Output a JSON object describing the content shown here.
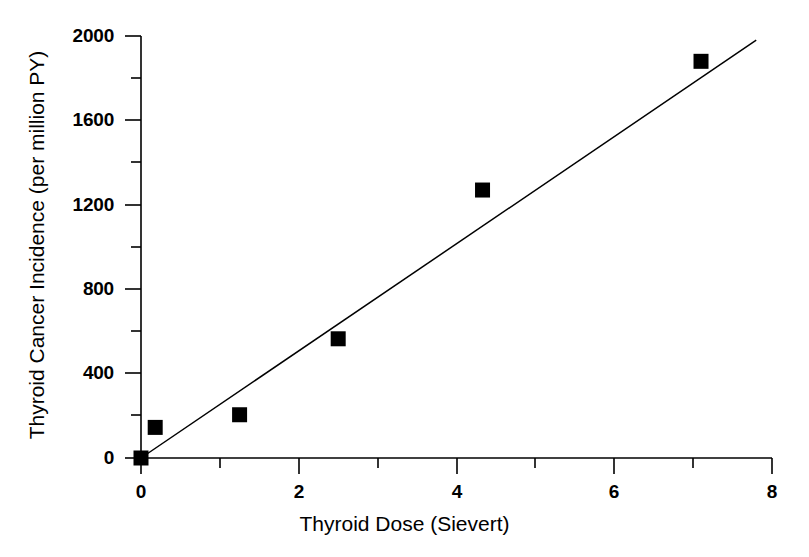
{
  "chart_data": {
    "type": "scatter",
    "title": "",
    "xlabel": "Thyroid Dose (Sievert)",
    "ylabel": "Thyroid Cancer Incidence (per million PY)",
    "xlim": [
      0,
      8
    ],
    "ylim": [
      0,
      2000
    ],
    "grid": false,
    "legend": null,
    "x_major_ticks": [
      0,
      2,
      4,
      6,
      8
    ],
    "x_minor_ticks": [
      1,
      3,
      5,
      7
    ],
    "x_tick_labels": [
      "0",
      "2",
      "4",
      "6",
      "8"
    ],
    "y_major_ticks": [
      0,
      400,
      800,
      1200,
      1600,
      2000
    ],
    "y_minor_ticks": [
      200,
      600,
      1000,
      1400,
      1800
    ],
    "y_tick_labels": [
      "0",
      "400",
      "800",
      "1200",
      "1600",
      "2000"
    ],
    "marker": {
      "shape": "square",
      "color": "#000000",
      "size_px": 15
    },
    "points": [
      {
        "x": 0.0,
        "y": 0
      },
      {
        "x": 0.18,
        "y": 145
      },
      {
        "x": 1.25,
        "y": 205
      },
      {
        "x": 2.5,
        "y": 565
      },
      {
        "x": 4.33,
        "y": 1270
      },
      {
        "x": 7.1,
        "y": 1880
      }
    ],
    "series": [
      {
        "name": "Thyroid cancer incidence by dose",
        "x": [
          0.0,
          0.18,
          1.25,
          2.5,
          4.33,
          7.1
        ],
        "values": [
          0,
          145,
          205,
          565,
          1270,
          1880
        ]
      }
    ],
    "trendline": {
      "type": "linear",
      "color": "#000000",
      "x_start": 0.0,
      "y_start": 0,
      "x_end": 7.8,
      "y_end": 1980
    },
    "axis_color": "#000000",
    "background": "#ffffff"
  }
}
